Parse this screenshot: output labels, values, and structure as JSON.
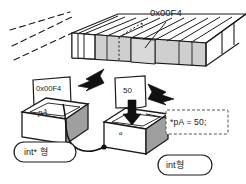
{
  "diagram": {
    "title_text": "",
    "background_color": "#ffffff",
    "ink_color": "#1a1a1a",
    "fill_gray": "#c9c9c9",
    "fill_light": "#e8e8e8",
    "fill_white": "#ffffff"
  },
  "memory_strip": {
    "address_label": "0x00F4",
    "cell_count": 14,
    "has_dashed_continuation": true,
    "has_dotted_cell_marker": true
  },
  "cards": {
    "address_card_value": "0x00F4",
    "value_card_value": "50"
  },
  "boxes": {
    "pointer_box": {
      "face_label": "pA",
      "type_label": "int* 형"
    },
    "value_box": {
      "face_label": "a",
      "type_label": "int형"
    }
  },
  "code_note": {
    "text": "*pA = 50;",
    "border_style": "dashed"
  },
  "arrows": {
    "left_arrow_name": "arrow-address-to-pointer",
    "right_arrow_name": "arrow-value-to-variable",
    "down_arrow_name": "arrow-into-value-box"
  }
}
